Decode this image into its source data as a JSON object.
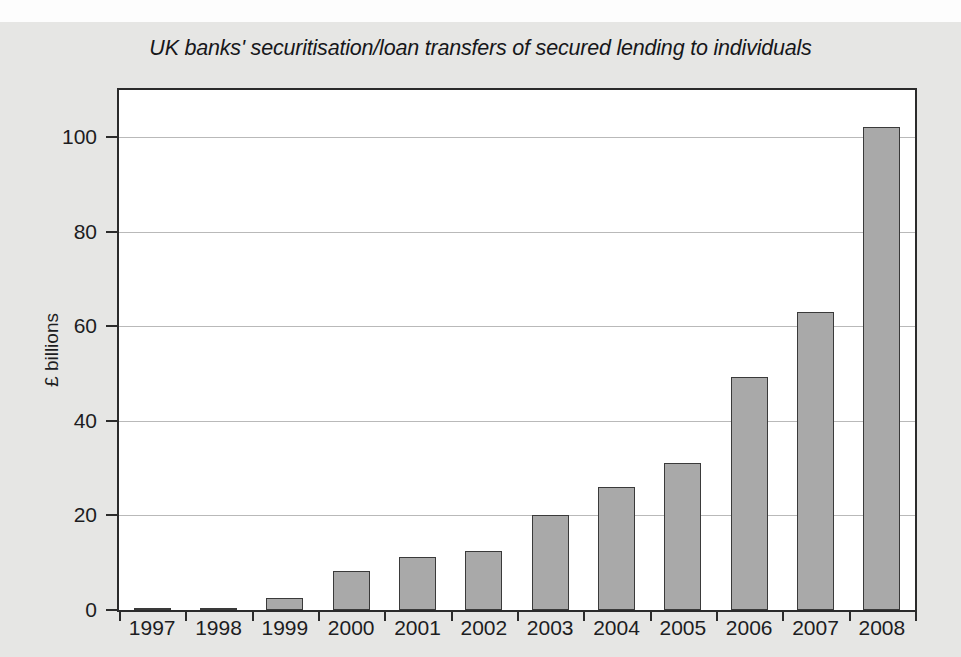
{
  "chart_data": {
    "type": "bar",
    "title": "UK banks' securitisation/loan transfers of secured lending to individuals",
    "xlabel": "",
    "ylabel": "£ billions",
    "categories": [
      "1997",
      "1998",
      "1999",
      "2000",
      "2001",
      "2002",
      "2003",
      "2004",
      "2005",
      "2006",
      "2007",
      "2008"
    ],
    "values": [
      0.3,
      0.3,
      2.5,
      8.3,
      11.2,
      12.5,
      20.0,
      26.0,
      31.0,
      49.2,
      63.1,
      102.2
    ],
    "ylim": [
      0,
      110
    ],
    "yticks": [
      0,
      20,
      40,
      60,
      80,
      100
    ],
    "ytick_labels": [
      "0",
      "20",
      "40",
      "60",
      "80",
      "100"
    ],
    "grid": true,
    "legend": false,
    "bar_color": "#a9a9a9",
    "bar_edge_color": "#3a3a3a",
    "background_color": "#e6e6e4",
    "plot_background_color": "#ffffff",
    "gridline_color": "#b9b9b9",
    "axis_color": "#2b2b2b"
  }
}
